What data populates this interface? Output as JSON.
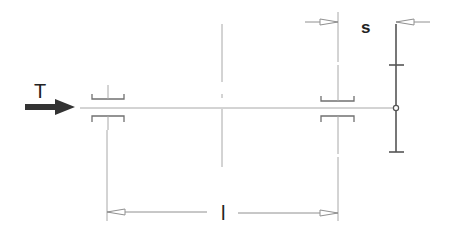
{
  "diagram": {
    "type": "shaft-bearing-deflection-schematic",
    "labels": {
      "force": "T",
      "span": "l",
      "offset": "s"
    },
    "colors": {
      "thin_line": "#9a9a9a",
      "thick_line": "#555555",
      "arrow_fill": "#333333",
      "text": "#222222",
      "background": "#ffffff"
    },
    "elements": [
      {
        "name": "force-arrow",
        "label": "T",
        "direction": "right"
      },
      {
        "name": "left-bearing"
      },
      {
        "name": "right-bearing"
      },
      {
        "name": "center-line"
      },
      {
        "name": "shaft-axis"
      },
      {
        "name": "dial-indicator",
        "position": "shaft end"
      },
      {
        "name": "span-dimension",
        "label": "l"
      },
      {
        "name": "offset-dimension",
        "label": "s"
      }
    ]
  }
}
